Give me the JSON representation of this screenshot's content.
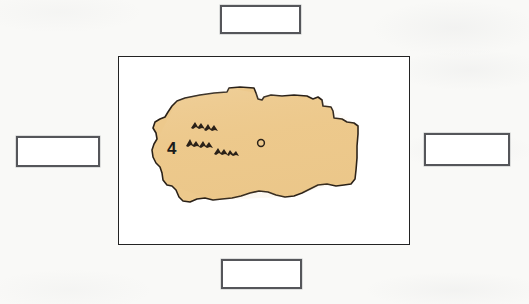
{
  "page": {
    "type": "map-labeling-worksheet",
    "background_color": "#f9f9f7",
    "width": 529,
    "height": 304
  },
  "map_frame": {
    "name": "map-frame",
    "border_color": "#232323",
    "background_color": "#ffffff"
  },
  "map": {
    "shape_name": "country-landmass",
    "fill_color": "#edc98c",
    "outline_color": "#2a2118",
    "region_label": "4",
    "features": [
      {
        "name": "mountain-range-symbol",
        "count": 3,
        "color": "#2a2118"
      },
      {
        "name": "capital-city-marker",
        "symbol": "o",
        "color": "#2a2118"
      }
    ]
  },
  "answer_boxes": {
    "top": {
      "label": "",
      "placeholder": ""
    },
    "left": {
      "label": "",
      "placeholder": ""
    },
    "right": {
      "label": "",
      "placeholder": ""
    },
    "bottom": {
      "label": "",
      "placeholder": ""
    }
  }
}
